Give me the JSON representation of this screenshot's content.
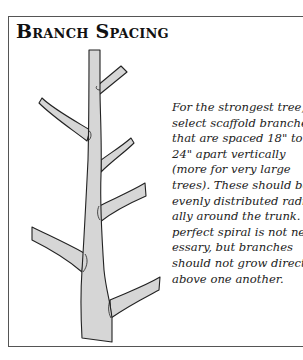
{
  "title": "Branch Spacing",
  "illustration": {
    "subject": "tree-trunk-with-scaffold-branches",
    "branch_count": 6,
    "fill_color": "#d6d6d6",
    "stroke_color": "#222222"
  },
  "caption": {
    "lines": [
      "For the strongest tree,",
      "select scaffold branches",
      "that are spaced 18\" to",
      "24\" apart vertically",
      "(more for very large",
      "trees). These should be",
      "evenly distributed radi-",
      "ally around the trunk. A",
      "perfect spiral is not nec-",
      "essary, but branches",
      "should not grow directly",
      "above one another."
    ]
  },
  "colors": {
    "border": "#555555",
    "text": "#222222",
    "background": "#ffffff"
  }
}
